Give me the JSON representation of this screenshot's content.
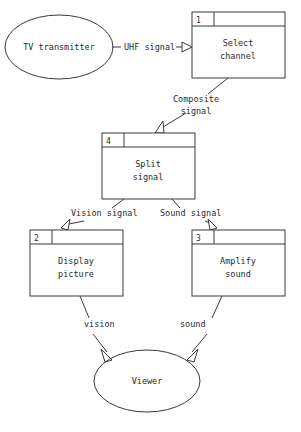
{
  "diagram": {
    "stroke_color": "#3a3a3a",
    "text_color": "#2b2b2b",
    "background": "#ffffff",
    "entities": [
      {
        "id": "tv-transmitter",
        "shape": "ellipse",
        "label": "TV transmitter",
        "cx": 59,
        "cy": 47,
        "rx": 54,
        "ry": 32
      },
      {
        "id": "viewer",
        "shape": "ellipse",
        "label": "Viewer",
        "cx": 147,
        "cy": 381,
        "rx": 53,
        "ry": 31
      }
    ],
    "processes": [
      {
        "id": "select-channel",
        "number": "1",
        "line1": "Select",
        "line2": "channel",
        "x": 192,
        "y": 12,
        "w": 93,
        "h": 66,
        "header_h": 14,
        "num_cell_w": 22
      },
      {
        "id": "split-signal",
        "number": "4",
        "line1": "Split",
        "line2": "signal",
        "x": 102,
        "y": 133,
        "w": 93,
        "h": 66,
        "header_h": 14,
        "num_cell_w": 22
      },
      {
        "id": "display-picture",
        "number": "2",
        "line1": "Display",
        "line2": "picture",
        "x": 30,
        "y": 230,
        "w": 93,
        "h": 66,
        "header_h": 14,
        "num_cell_w": 22
      },
      {
        "id": "amplify-sound",
        "number": "3",
        "line1": "Amplify",
        "line2": "sound",
        "x": 192,
        "y": 230,
        "w": 93,
        "h": 66,
        "header_h": 14,
        "num_cell_w": 22
      }
    ],
    "flows": [
      {
        "id": "uhf-signal",
        "label": "UHF signal",
        "from": "tv-transmitter",
        "to": "select-channel",
        "label_x": 113,
        "label_y": 50
      },
      {
        "id": "composite-signal",
        "label_line1": "Composite",
        "label_line2": "signal",
        "from": "select-channel",
        "to": "split-signal",
        "label_x": 196,
        "label_y": 102
      },
      {
        "id": "vision-signal",
        "label": "Vision signal",
        "from": "split-signal",
        "to": "display-picture",
        "label_x": 71,
        "label_y": 216
      },
      {
        "id": "sound-signal",
        "label": "Sound signal",
        "from": "split-signal",
        "to": "amplify-sound",
        "label_x": 160,
        "label_y": 216
      },
      {
        "id": "vision",
        "label": "vision",
        "from": "display-picture",
        "to": "viewer",
        "label_x": 84,
        "label_y": 327
      },
      {
        "id": "sound",
        "label": "sound",
        "from": "amplify-sound",
        "to": "viewer",
        "label_x": 180,
        "label_y": 327
      }
    ]
  }
}
